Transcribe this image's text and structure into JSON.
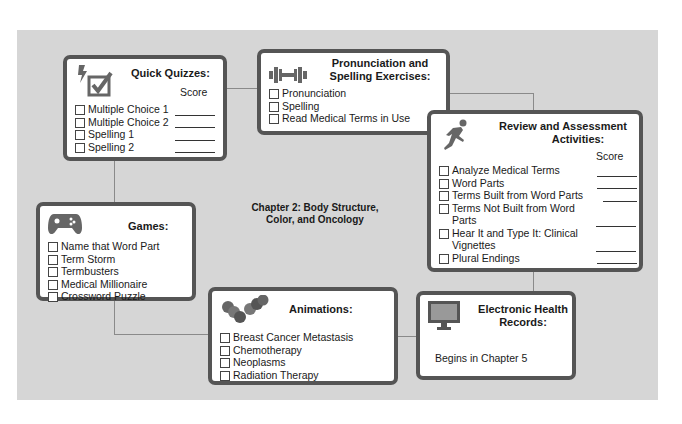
{
  "center": {
    "line1": "Chapter 2: Body Structure,",
    "line2": "Color, and Oncology"
  },
  "score_label": "Score",
  "quick_quizzes": {
    "title": "Quick Quizzes:",
    "icon": "lightning-checkbox-icon",
    "items": [
      "Multiple Choice 1",
      "Multiple Choice 2",
      "Spelling 1",
      "Spelling 2"
    ]
  },
  "pronunciation": {
    "title_line1": "Pronunciation and",
    "title_line2": "Spelling Exercises:",
    "icon": "dumbbell-icon",
    "items": [
      "Pronunciation",
      "Spelling",
      "Read Medical Terms in Use"
    ]
  },
  "review": {
    "title_line1": "Review and Assessment",
    "title_line2": "Activities:",
    "icon": "running-person-icon",
    "items": [
      "Analyze Medical Terms",
      "Word Parts",
      "Terms Built from Word Parts",
      "Terms Not Built from Word Parts",
      "Hear It and Type It: Clinical Vignettes",
      "Plural Endings"
    ]
  },
  "games": {
    "title": "Games:",
    "icon": "gamepad-icon",
    "items": [
      "Name that Word Part",
      "Term Storm",
      "Termbusters",
      "Medical Millionaire",
      "Crossword Puzzle"
    ]
  },
  "animations": {
    "title": "Animations:",
    "icon": "cells-icon",
    "items": [
      "Breast Cancer Metastasis",
      "Chemotherapy",
      "Neoplasms",
      "Radiation Therapy"
    ]
  },
  "ehr": {
    "title_line1": "Electronic Health",
    "title_line2": "Records:",
    "icon": "monitor-icon",
    "text": "Begins in Chapter 5"
  },
  "colors": {
    "background": "#d6d6d6",
    "box_border": "#555555",
    "connector": "#8a8a8a",
    "icon": "#666666"
  }
}
